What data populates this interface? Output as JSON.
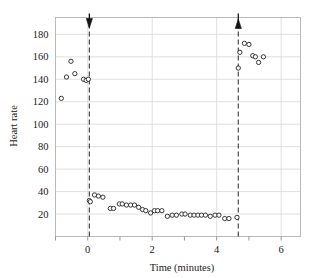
{
  "chart_data": {
    "type": "scatter",
    "title": "",
    "xlabel": "Time (minutes)",
    "ylabel": "Heart rate",
    "xlim": [
      -1.0,
      6.6
    ],
    "ylim": [
      0,
      195
    ],
    "grid": true,
    "legend": null,
    "xticks": [
      0,
      2,
      4,
      6
    ],
    "xminorticks": [
      -1,
      1,
      3,
      5
    ],
    "yticks": [
      20,
      40,
      60,
      80,
      100,
      120,
      140,
      160,
      180
    ],
    "xticklabels": [
      "0",
      "2",
      "4",
      "6"
    ],
    "yticklabels": [
      "20",
      "40",
      "60",
      "80",
      "100",
      "120",
      "140",
      "160",
      "180"
    ],
    "marker": "open-circle",
    "marker_color": "#2d2d2d",
    "annotations": [
      {
        "name": "dive-start-line",
        "x": 0.05,
        "label": "",
        "style": "dashed-vertical-with-down-arrow"
      },
      {
        "name": "dive-end-line",
        "x": 4.67,
        "label": "",
        "style": "dashed-vertical-with-up-arrow"
      }
    ],
    "points": [
      {
        "x": -0.82,
        "y": 123
      },
      {
        "x": -0.66,
        "y": 142
      },
      {
        "x": -0.52,
        "y": 156
      },
      {
        "x": -0.4,
        "y": 145
      },
      {
        "x": -0.13,
        "y": 140
      },
      {
        "x": -0.05,
        "y": 139
      },
      {
        "x": 0.02,
        "y": 140
      },
      {
        "x": 0.05,
        "y": 32
      },
      {
        "x": 0.08,
        "y": 31
      },
      {
        "x": 0.21,
        "y": 37
      },
      {
        "x": 0.33,
        "y": 36
      },
      {
        "x": 0.47,
        "y": 35
      },
      {
        "x": 0.7,
        "y": 25
      },
      {
        "x": 0.8,
        "y": 25
      },
      {
        "x": 0.98,
        "y": 29
      },
      {
        "x": 1.07,
        "y": 29
      },
      {
        "x": 1.2,
        "y": 28
      },
      {
        "x": 1.33,
        "y": 28
      },
      {
        "x": 1.45,
        "y": 28
      },
      {
        "x": 1.58,
        "y": 26
      },
      {
        "x": 1.7,
        "y": 24
      },
      {
        "x": 1.8,
        "y": 23
      },
      {
        "x": 1.95,
        "y": 21
      },
      {
        "x": 2.07,
        "y": 23
      },
      {
        "x": 2.17,
        "y": 23
      },
      {
        "x": 2.3,
        "y": 23
      },
      {
        "x": 2.47,
        "y": 18
      },
      {
        "x": 2.62,
        "y": 19
      },
      {
        "x": 2.75,
        "y": 19
      },
      {
        "x": 2.92,
        "y": 20
      },
      {
        "x": 3.02,
        "y": 20
      },
      {
        "x": 3.18,
        "y": 19
      },
      {
        "x": 3.3,
        "y": 19
      },
      {
        "x": 3.42,
        "y": 19
      },
      {
        "x": 3.53,
        "y": 19
      },
      {
        "x": 3.65,
        "y": 19
      },
      {
        "x": 3.8,
        "y": 18
      },
      {
        "x": 3.95,
        "y": 19
      },
      {
        "x": 4.07,
        "y": 19
      },
      {
        "x": 4.25,
        "y": 16
      },
      {
        "x": 4.38,
        "y": 16
      },
      {
        "x": 4.63,
        "y": 17
      },
      {
        "x": 4.67,
        "y": 150
      },
      {
        "x": 4.72,
        "y": 164
      },
      {
        "x": 4.86,
        "y": 172
      },
      {
        "x": 5.0,
        "y": 171
      },
      {
        "x": 5.12,
        "y": 161
      },
      {
        "x": 5.2,
        "y": 160
      },
      {
        "x": 5.3,
        "y": 155
      },
      {
        "x": 5.45,
        "y": 160
      }
    ]
  }
}
